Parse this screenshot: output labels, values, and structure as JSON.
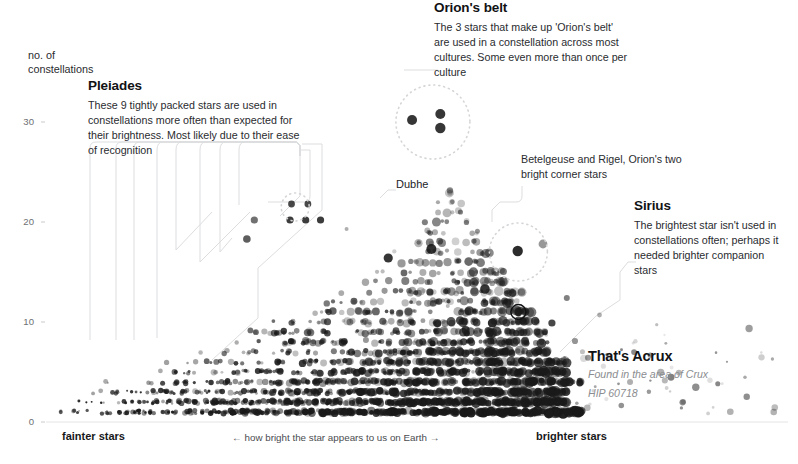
{
  "axes": {
    "y_axis_label": "no. of\nconstellations",
    "y_axis_label_line1": "no. of",
    "y_axis_label_line2": "constellations",
    "y_ticks": [
      0,
      10,
      20,
      30
    ],
    "x_left_label": "fainter stars",
    "x_right_label": "brighter stars",
    "x_center_label": "← how bright the star appears to us on Earth →"
  },
  "annotations": {
    "pleiades": {
      "title": "Pleiades",
      "body": "These 9 tightly packed stars are used in constellations more often than expected for their brightness. Most likely due to their ease of recognition"
    },
    "orion_belt": {
      "title": "Orion's belt",
      "body": "The 3 stars that make up 'Orion's belt' are used in a constellation across most cultures. Some even more than once per culture"
    },
    "sirius": {
      "title": "Sirius",
      "body": "The brightest star isn't used in constellations often; perhaps it needed brighter companion stars"
    },
    "betelgeuse": {
      "title": "",
      "body": "Betelgeuse and Rigel, Orion's two bright corner stars"
    },
    "dubhe": {
      "label": "Dubhe"
    }
  },
  "tooltip": {
    "name": "That's Acrux",
    "area": "Found in the area of Crux",
    "catalog_id": "HIP 60718"
  },
  "colors": {
    "background": "#ffffff",
    "dot": "#1a1a1a",
    "text": "#17181a",
    "muted_text": "#8b8d90",
    "leader_line": "#dcdddf",
    "highlight_ring": "#111214"
  },
  "chart_data": {
    "type": "scatter",
    "title": "",
    "xlabel": "← how bright the star appears to us on Earth →",
    "ylabel": "no. of constellations",
    "xlim": [
      0,
      100
    ],
    "ylim": [
      0,
      33
    ],
    "grid": false,
    "legend": null,
    "highlighted_points": [
      {
        "label": "Acrux",
        "catalog": "HIP 60718",
        "x": 63.5,
        "y": 11,
        "marker": "ring"
      },
      {
        "label": "Sirius",
        "x": 78.5,
        "y": 4,
        "marker": "dot"
      },
      {
        "label": "Dubhe",
        "x": 51.5,
        "y": 14,
        "marker": "dot"
      }
    ],
    "highlight_circles": [
      {
        "label": "Orion's belt",
        "cx": 52.0,
        "cy": 30.0,
        "r_px": 37,
        "n_points": 3
      },
      {
        "label": "Betelgeuse and Rigel",
        "cx": 63.5,
        "cy": 17.0,
        "r_px": 29,
        "n_points": 2
      },
      {
        "label": "Pleiades",
        "cx": 33.5,
        "cy": 21.5,
        "r_px": 14,
        "n_points": 2
      }
    ],
    "points": [
      {
        "x": 49.2,
        "y": 30.2,
        "s": 5.0,
        "o": 0.88
      },
      {
        "x": 53.0,
        "y": 30.8,
        "s": 5.0,
        "o": 0.88
      },
      {
        "x": 53.0,
        "y": 29.4,
        "s": 5.2,
        "o": 0.88
      },
      {
        "x": 33.0,
        "y": 21.8,
        "s": 3.4,
        "o": 0.8
      },
      {
        "x": 35.2,
        "y": 21.8,
        "s": 3.4,
        "o": 0.8
      },
      {
        "x": 28.0,
        "y": 20.2,
        "s": 3.6,
        "o": 0.62
      },
      {
        "x": 32.8,
        "y": 20.2,
        "s": 3.6,
        "o": 0.85
      },
      {
        "x": 34.9,
        "y": 20.2,
        "s": 3.6,
        "o": 0.85
      },
      {
        "x": 36.9,
        "y": 20.2,
        "s": 3.6,
        "o": 0.85
      },
      {
        "x": 40.4,
        "y": 19.3,
        "s": 2.0,
        "o": 0.35
      },
      {
        "x": 27.0,
        "y": 18.3,
        "s": 3.8,
        "o": 0.7
      },
      {
        "x": 51.8,
        "y": 17.3,
        "s": 5.0,
        "o": 0.9
      },
      {
        "x": 46.0,
        "y": 16.4,
        "s": 4.6,
        "o": 0.88
      },
      {
        "x": 63.4,
        "y": 17.1,
        "s": 5.2,
        "o": 0.92
      },
      {
        "x": 66.8,
        "y": 17.8,
        "s": 4.4,
        "o": 0.45
      },
      {
        "x": 51.6,
        "y": 14.0,
        "s": 3.0,
        "o": 0.5
      },
      {
        "x": 51.6,
        "y": 13.0,
        "s": 3.6,
        "o": 0.8
      },
      {
        "x": 52.0,
        "y": 12.2,
        "s": 2.8,
        "o": 0.4
      },
      {
        "x": 54.0,
        "y": 11.6,
        "s": 2.0,
        "o": 0.3
      },
      {
        "x": 57.5,
        "y": 11.2,
        "s": 2.2,
        "o": 0.45
      },
      {
        "x": 63.5,
        "y": 11.0,
        "s": 4.2,
        "o": 0.95
      },
      {
        "x": 59.0,
        "y": 13.3,
        "s": 4.8,
        "o": 0.88
      },
      {
        "x": 55.6,
        "y": 13.2,
        "s": 4.0,
        "o": 0.4
      },
      {
        "x": 70.0,
        "y": 12.4,
        "s": 3.0,
        "o": 0.55
      },
      {
        "x": 74.4,
        "y": 10.7,
        "s": 2.4,
        "o": 0.35
      },
      {
        "x": 60.0,
        "y": 9.9,
        "s": 4.6,
        "o": 0.92
      },
      {
        "x": 68.0,
        "y": 9.9,
        "s": 3.6,
        "o": 0.8
      },
      {
        "x": 56.4,
        "y": 9.2,
        "s": 4.0,
        "o": 0.85
      },
      {
        "x": 78.5,
        "y": 4.0,
        "s": 3.0,
        "o": 0.35
      },
      {
        "x": 45.0,
        "y": 9.0,
        "s": 3.2,
        "o": 0.5
      },
      {
        "x": 43.0,
        "y": 8.2,
        "s": 3.0,
        "o": 0.45
      }
    ]
  }
}
